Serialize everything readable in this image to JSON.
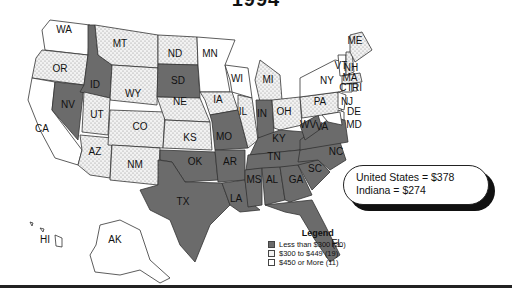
{
  "title": "1994",
  "colors": {
    "low": "#6b6b6b",
    "mid": "#f2f2f2",
    "high": "#ffffff",
    "border": "#333333"
  },
  "callout": {
    "line1": "United States = $378",
    "line2": "Indiana = $274"
  },
  "legend": {
    "title": "Legend",
    "items": [
      {
        "label": "Less than $300 (20)",
        "category": "low"
      },
      {
        "label": "$300 to $449 (19)",
        "category": "mid"
      },
      {
        "label": "$450 or More (11)",
        "category": "high"
      }
    ]
  },
  "states": {
    "WA": "high",
    "OR": "mid",
    "CA": "high",
    "NV": "low",
    "ID": "low",
    "MT": "mid",
    "WY": "mid",
    "UT": "mid",
    "AZ": "mid",
    "CO": "mid",
    "NM": "mid",
    "ND": "mid",
    "SD": "low",
    "NE": "mid",
    "KS": "mid",
    "OK": "low",
    "TX": "low",
    "MN": "high",
    "IA": "mid",
    "MO": "low",
    "AR": "low",
    "LA": "low",
    "WI": "high",
    "IL": "mid",
    "MI": "mid",
    "IN": "low",
    "OH": "mid",
    "KY": "low",
    "TN": "low",
    "MS": "low",
    "AL": "low",
    "GA": "low",
    "FL": "low",
    "SC": "low",
    "NC": "low",
    "VA": "low",
    "WV": "low",
    "PA": "mid",
    "NY": "high",
    "VT": "high",
    "NH": "mid",
    "ME": "mid",
    "MA": "mid",
    "CT": "high",
    "RI": "high",
    "NJ": "high",
    "DE": "high",
    "MD": "high",
    "AK": "high",
    "HI": "high"
  },
  "labels": {
    "WA": "WA",
    "OR": "OR",
    "CA": "CA",
    "NV": "NV",
    "ID": "ID",
    "MT": "MT",
    "WY": "WY",
    "UT": "UT",
    "AZ": "AZ",
    "CO": "CO",
    "NM": "NM",
    "ND": "ND",
    "SD": "SD",
    "NE": "NE",
    "KS": "KS",
    "OK": "OK",
    "TX": "TX",
    "MN": "MN",
    "IA": "IA",
    "MO": "MO",
    "AR": "AR",
    "LA": "LA",
    "WI": "WI",
    "IL": "IL",
    "MI": "MI",
    "IN": "IN",
    "OH": "OH",
    "KY": "KY",
    "TN": "TN",
    "MS": "MS",
    "AL": "AL",
    "GA": "GA",
    "FL": "FL",
    "SC": "SC",
    "NC": "NC",
    "VA": "VA",
    "WV": "WV",
    "PA": "PA",
    "NY": "NY",
    "VT": "VT",
    "NH": "NH",
    "ME": "ME",
    "MA": "MA",
    "CT": "CT",
    "RI": "RI",
    "NJ": "NJ",
    "DE": "DE",
    "MD": "MD",
    "AK": "AK",
    "HI": "HI"
  },
  "chart_data": {
    "type": "choropleth",
    "title": "1994",
    "annotation": [
      "United States = $378",
      "Indiana = $274"
    ],
    "legend": [
      {
        "label": "Less than $300",
        "count": 20
      },
      {
        "label": "$300 to $449",
        "count": 19
      },
      {
        "label": "$450 or More",
        "count": 11
      }
    ],
    "legend_position": "bottom-center"
  }
}
